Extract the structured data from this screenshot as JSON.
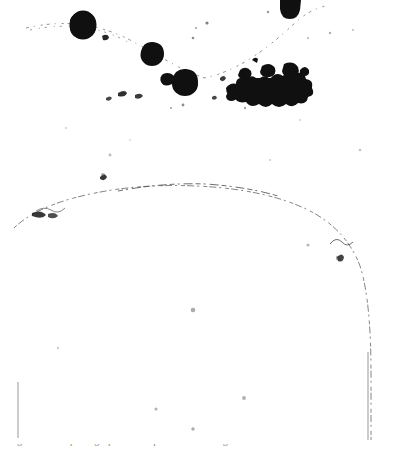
{
  "image": {
    "kind": "scanned-bitonal-figure",
    "width": 399,
    "height": 455,
    "background_color": "#ffffff",
    "ink_color": "#121212",
    "faint_ink_color": "#9a9a9a",
    "description": "High-contrast photocopied scan: dark ink blobs along a faint dashed arc near the top, a large faint hand-drawn arch/dome outline across the middle, two faint vertical rule lines, and a clipped line of caption text along the bottom edge."
  },
  "figure": {
    "arch_label": "arch-outline",
    "dashed_arc_label": "dashed-trace-curve",
    "blobs": [
      {
        "name": "ink-blob-large-left",
        "cx": 83,
        "cy": 25,
        "rx": 13,
        "ry": 14
      },
      {
        "name": "ink-blob-mid-left",
        "cx": 152,
        "cy": 55,
        "rx": 11,
        "ry": 11
      },
      {
        "name": "ink-blob-mid-center",
        "cx": 185,
        "cy": 84,
        "rx": 13,
        "ry": 12
      },
      {
        "name": "ink-blob-small-left",
        "cx": 169,
        "cy": 79,
        "rx": 6,
        "ry": 5
      },
      {
        "name": "ink-blob-clipped-top-right",
        "cx": 290,
        "cy": 13,
        "rx": 10,
        "ry": 9
      }
    ],
    "blob_cluster": {
      "name": "ink-blob-cluster-right",
      "x": 226,
      "y": 64,
      "width": 78,
      "height": 36
    },
    "specks": [
      {
        "cx": 193,
        "cy": 310,
        "r": 2.3,
        "opacity": 0.42
      },
      {
        "cx": 244,
        "cy": 398,
        "r": 1.9,
        "opacity": 0.4
      },
      {
        "cx": 156,
        "cy": 409,
        "r": 1.6,
        "opacity": 0.38
      },
      {
        "cx": 193,
        "cy": 429,
        "r": 1.7,
        "opacity": 0.42
      },
      {
        "cx": 110,
        "cy": 155,
        "r": 1.4,
        "opacity": 0.35
      },
      {
        "cx": 360,
        "cy": 150,
        "r": 1.3,
        "opacity": 0.3
      },
      {
        "cx": 103,
        "cy": 175,
        "r": 2.0,
        "opacity": 0.45
      },
      {
        "cx": 338,
        "cy": 258,
        "r": 2.2,
        "opacity": 0.45
      },
      {
        "cx": 308,
        "cy": 245,
        "r": 1.6,
        "opacity": 0.35
      },
      {
        "cx": 58,
        "cy": 348,
        "r": 1.2,
        "opacity": 0.25
      }
    ],
    "vertical_rules": [
      {
        "name": "vertical-rule-left",
        "x": 18,
        "y1": 382,
        "y2": 438
      },
      {
        "name": "vertical-rule-right",
        "x": 368,
        "y1": 352,
        "y2": 440
      }
    ]
  },
  "caption": {
    "text": "Fig. 12.  Microphotograph of the specimen showing the arch and inclusions.",
    "note": "clipped-at-bottom-edge"
  }
}
